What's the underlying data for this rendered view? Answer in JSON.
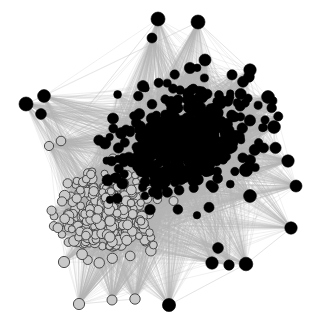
{
  "figure": {
    "kind": "network-graph",
    "title": "Force-directed network graph",
    "width": 319,
    "height": 327,
    "background_color": "#ffffff"
  },
  "chart_data": {
    "type": "scatter",
    "subtype": "node-link-network",
    "title": "",
    "xlabel": "",
    "ylabel": "",
    "xlim": [
      0,
      319
    ],
    "ylim": [
      0,
      327
    ],
    "grid": false,
    "legend_position": "none",
    "axes_visible": false,
    "layout": "force-directed",
    "background_color": "#ffffff",
    "edge_style": {
      "color": "#b4b4b4",
      "core_bundle_color": "#9b9b9b",
      "width": 0.45,
      "opacity": 0.55
    },
    "node_groups": [
      {
        "name": "community-a-black",
        "fill": "#000000",
        "stroke": "#000000",
        "stroke_width": 0.6,
        "count": 470,
        "region": "upper-right core and outer hubs",
        "radius_core": 4.6,
        "radius_hub": 6.4
      },
      {
        "name": "community-b-light",
        "fill": "#c9c9c9",
        "stroke": "#3a3a3a",
        "stroke_width": 0.9,
        "count": 300,
        "region": "lower-left core",
        "radius_core": 4.3,
        "radius_hub": 5.4
      }
    ],
    "hull": [
      [
        160,
        16
      ],
      [
        232,
        22
      ],
      [
        278,
        62
      ],
      [
        296,
        100
      ],
      [
        300,
        128
      ],
      [
        296,
        164
      ],
      [
        300,
        192
      ],
      [
        292,
        228
      ],
      [
        262,
        266
      ],
      [
        214,
        292
      ],
      [
        168,
        310
      ],
      [
        118,
        304
      ],
      [
        80,
        288
      ],
      [
        60,
        248
      ],
      [
        44,
        196
      ],
      [
        30,
        152
      ],
      [
        24,
        108
      ],
      [
        42,
        70
      ],
      [
        86,
        40
      ],
      [
        124,
        22
      ]
    ],
    "peripheral_hubs": [
      {
        "x": 158,
        "y": 19,
        "r": 7.0,
        "group": "community-a-black"
      },
      {
        "x": 198,
        "y": 22,
        "r": 7.0,
        "group": "community-a-black"
      },
      {
        "x": 152,
        "y": 38,
        "r": 5.0,
        "group": "community-a-black"
      },
      {
        "x": 205,
        "y": 60,
        "r": 6.0,
        "group": "community-a-black"
      },
      {
        "x": 190,
        "y": 68,
        "r": 5.6,
        "group": "community-a-black"
      },
      {
        "x": 250,
        "y": 70,
        "r": 6.2,
        "group": "community-a-black"
      },
      {
        "x": 268,
        "y": 97,
        "r": 6.4,
        "group": "community-a-black"
      },
      {
        "x": 274,
        "y": 127,
        "r": 6.4,
        "group": "community-a-black"
      },
      {
        "x": 288,
        "y": 161,
        "r": 6.2,
        "group": "community-a-black"
      },
      {
        "x": 246,
        "y": 170,
        "r": 6.6,
        "group": "community-a-black"
      },
      {
        "x": 296,
        "y": 186,
        "r": 6.0,
        "group": "community-a-black"
      },
      {
        "x": 250,
        "y": 196,
        "r": 6.4,
        "group": "community-a-black"
      },
      {
        "x": 291,
        "y": 228,
        "r": 6.2,
        "group": "community-a-black"
      },
      {
        "x": 246,
        "y": 264,
        "r": 6.8,
        "group": "community-a-black"
      },
      {
        "x": 229,
        "y": 265,
        "r": 5.2,
        "group": "community-a-black"
      },
      {
        "x": 212,
        "y": 263,
        "r": 6.2,
        "group": "community-a-black"
      },
      {
        "x": 218,
        "y": 248,
        "r": 5.4,
        "group": "community-a-black"
      },
      {
        "x": 169,
        "y": 305,
        "r": 6.6,
        "group": "community-a-black"
      },
      {
        "x": 135,
        "y": 299,
        "r": 5.2,
        "group": "community-b-light"
      },
      {
        "x": 112,
        "y": 300,
        "r": 5.0,
        "group": "community-b-light"
      },
      {
        "x": 79,
        "y": 304,
        "r": 5.6,
        "group": "community-b-light"
      },
      {
        "x": 64,
        "y": 262,
        "r": 5.6,
        "group": "community-b-light"
      },
      {
        "x": 26,
        "y": 104,
        "r": 7.0,
        "group": "community-a-black"
      },
      {
        "x": 44,
        "y": 96,
        "r": 6.4,
        "group": "community-a-black"
      },
      {
        "x": 41,
        "y": 114,
        "r": 5.4,
        "group": "community-a-black"
      },
      {
        "x": 61,
        "y": 141,
        "r": 4.8,
        "group": "community-b-light"
      },
      {
        "x": 49,
        "y": 146,
        "r": 4.6,
        "group": "community-b-light"
      },
      {
        "x": 174,
        "y": 118,
        "r": 5.0,
        "group": "community-a-black"
      }
    ],
    "core_centroids": [
      {
        "name": "community-a-black",
        "x": 185,
        "y": 140
      },
      {
        "name": "community-b-light",
        "x": 105,
        "y": 215
      }
    ]
  }
}
